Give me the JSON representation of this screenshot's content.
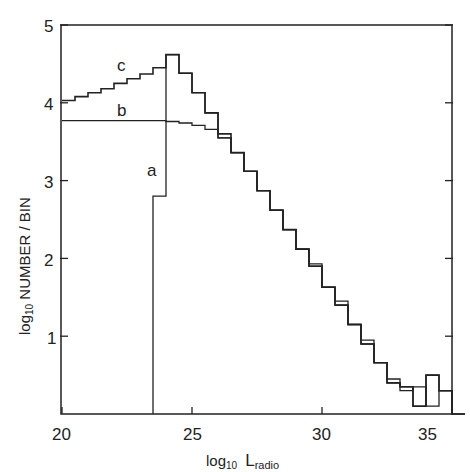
{
  "chart_data": {
    "type": "line",
    "style": "step-histogram",
    "title": "",
    "xlabel": "log10 L_radio",
    "ylabel": "log10 NUMBER / BIN",
    "xlim": [
      20,
      36
    ],
    "ylim": [
      0,
      5
    ],
    "x_ticks": [
      20,
      25,
      30,
      35
    ],
    "y_ticks": [
      1,
      2,
      3,
      4,
      5
    ],
    "grid": false,
    "legend": "inline labels a, b, c",
    "bin_width": 0.5,
    "series": [
      {
        "name": "c",
        "bin_edges": [
          20.0,
          20.5,
          21.0,
          21.5,
          22.0,
          22.5,
          23.0,
          23.5,
          24.0,
          24.5,
          25.0,
          25.5,
          26.0,
          26.5,
          27.0,
          27.5,
          28.0,
          28.5,
          29.0,
          29.5,
          30.0,
          30.5,
          31.0,
          31.5,
          32.0,
          32.5,
          33.0,
          33.5,
          34.0,
          34.5,
          35.0
        ],
        "values": [
          4.03,
          4.08,
          4.13,
          4.18,
          4.25,
          4.31,
          4.37,
          4.45,
          4.62,
          4.38,
          4.13,
          3.87,
          3.6,
          3.36,
          3.12,
          2.87,
          2.62,
          2.37,
          2.12,
          1.9,
          1.63,
          1.4,
          1.15,
          0.9,
          0.66,
          0.4,
          0.35,
          0.1,
          0.5,
          0.3
        ]
      },
      {
        "name": "b",
        "bin_edges": [
          20.0,
          23.8,
          24.0,
          24.5,
          25.0,
          25.5,
          26.0,
          26.5,
          27.0,
          27.5,
          28.0,
          28.5,
          29.0,
          29.5,
          30.0,
          30.5,
          31.0,
          31.5,
          32.0,
          32.5,
          33.0,
          33.5,
          34.0,
          34.5,
          35.0,
          35.5
        ],
        "values": [
          3.77,
          3.77,
          3.76,
          3.74,
          3.71,
          3.66,
          3.55,
          3.36,
          3.12,
          2.87,
          2.62,
          2.37,
          2.12,
          1.93,
          1.63,
          1.45,
          1.15,
          0.95,
          0.66,
          0.45,
          0.3,
          0.35,
          0.1,
          0.3,
          0.0
        ]
      },
      {
        "name": "a",
        "bin_edges": [
          23.5,
          24.0,
          24.5,
          25.0,
          25.5,
          26.0,
          26.5,
          27.0,
          27.5,
          28.0,
          28.5,
          29.0,
          29.5,
          30.0,
          30.5,
          31.0,
          31.5,
          32.0,
          32.5,
          33.0,
          33.5,
          34.0,
          34.5,
          35.0,
          35.5
        ],
        "values": [
          2.8,
          4.62,
          4.38,
          4.13,
          3.87,
          3.55,
          3.36,
          3.12,
          2.87,
          2.62,
          2.37,
          2.12,
          1.9,
          1.63,
          1.4,
          1.15,
          0.9,
          0.66,
          0.4,
          0.35,
          0.1,
          0.5,
          0.3,
          0.0
        ]
      }
    ],
    "annotations": [
      {
        "text": "c",
        "x": 22.0,
        "y": 4.55
      },
      {
        "text": "b",
        "x": 22.0,
        "y": 3.87
      },
      {
        "text": "a",
        "x": 22.8,
        "y": 3.1
      }
    ]
  },
  "axes": {
    "x_tick_labels": [
      "20",
      "25",
      "30",
      "35"
    ],
    "y_tick_labels": [
      "1",
      "2",
      "3",
      "4",
      "5"
    ],
    "xlabel_main": "log",
    "xlabel_sub": "10",
    "xlabel_var": "L",
    "xlabel_var_sub": "radio",
    "ylabel_main": "log",
    "ylabel_sub": "10",
    "ylabel_rest": " NUMBER / BIN"
  },
  "labels": {
    "a": "a",
    "b": "b",
    "c": "c"
  }
}
